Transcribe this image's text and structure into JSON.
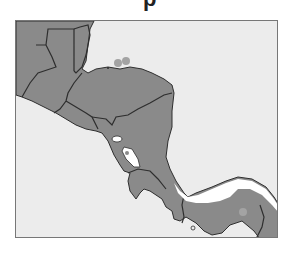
{
  "title_fragment": "p",
  "map": {
    "region": "Central America",
    "colors": {
      "sea": "#ececec",
      "land": "#8a8a8a",
      "border": "#2e2e2e",
      "lake": "#ffffff",
      "highlight_zone": "#ffffff",
      "marker": "#a3a3a3"
    },
    "countries": [
      "Mexico",
      "Guatemala",
      "Belize",
      "Honduras",
      "El Salvador",
      "Nicaragua",
      "Costa Rica",
      "Panama",
      "Colombia"
    ],
    "lakes": [
      "Lake Managua",
      "Lake Nicaragua"
    ],
    "markers": [
      {
        "name": "bay-islands-marker-1",
        "x": 102,
        "y": 41
      },
      {
        "name": "bay-islands-marker-2",
        "x": 110,
        "y": 39
      },
      {
        "name": "panama-marker",
        "x": 227,
        "y": 192
      }
    ]
  }
}
